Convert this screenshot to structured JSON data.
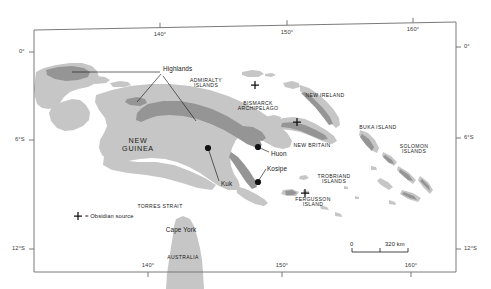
{
  "figure": {
    "type": "reference-map",
    "region": "New Guinea and Island Melanesia",
    "background_color": "#ffffff",
    "frame_color": "#6b6b6b",
    "land_lowland_color": "#c6c6c6",
    "land_highland_color": "#959595",
    "site_marker_color": "#111111",
    "text_color": "#1a1a1a"
  },
  "graticule": {
    "longitude_ticks": [
      {
        "label": "140°",
        "x": 160
      },
      {
        "label": "150°",
        "x": 287
      },
      {
        "label": "160°",
        "x": 413
      }
    ],
    "latitude_ticks": [
      {
        "label": "0°",
        "y": 52
      },
      {
        "label": "6°S",
        "y": 140
      },
      {
        "label": "12°S",
        "y": 249
      }
    ],
    "bottom_longitude_ticks": [
      {
        "label": "140°",
        "x": 148
      },
      {
        "label": "150°",
        "x": 282
      },
      {
        "label": "160°",
        "x": 411
      }
    ]
  },
  "labels": {
    "regions": [
      {
        "name": "new-guinea",
        "text": "NEW\nGUINEA",
        "x": 137,
        "y": 143,
        "style": "region"
      },
      {
        "name": "australia",
        "text": "AUSTRALIA",
        "x": 183,
        "y": 258,
        "style": "caps"
      },
      {
        "name": "cape-york",
        "text": "Cape York",
        "x": 181,
        "y": 231,
        "style": "site"
      },
      {
        "name": "torres-strait",
        "text": "TORRES STRAIT",
        "x": 160,
        "y": 207,
        "style": "caps"
      },
      {
        "name": "admiralty-islands",
        "text": "ADMIRALTY\nISLANDS",
        "x": 206,
        "y": 81,
        "style": "caps"
      },
      {
        "name": "bismarck-archipelago",
        "text": "BISMARCK\nARCHIPELAGO",
        "x": 258,
        "y": 104,
        "style": "caps"
      },
      {
        "name": "new-ireland",
        "text": "NEW IRELAND",
        "x": 325,
        "y": 96,
        "style": "caps"
      },
      {
        "name": "new-britain",
        "text": "NEW BRITAIN",
        "x": 312,
        "y": 146,
        "style": "caps"
      },
      {
        "name": "buka-island",
        "text": "BUKA ISLAND",
        "x": 378,
        "y": 128,
        "style": "caps"
      },
      {
        "name": "solomon-islands",
        "text": "SOLOMON\nISLANDS",
        "x": 414,
        "y": 147,
        "style": "caps"
      },
      {
        "name": "trobriand-islands",
        "text": "TROBRIAND\nISLANDS",
        "x": 334,
        "y": 177,
        "style": "caps"
      },
      {
        "name": "fergusson-island",
        "text": "FERGUSSON\nISLAND",
        "x": 312,
        "y": 200,
        "style": "caps"
      }
    ],
    "annotations": [
      {
        "name": "highlands",
        "text": "Highlands",
        "x": 163,
        "y": 69,
        "style": "site"
      }
    ],
    "sites": [
      {
        "name": "kuk",
        "text": "Kuk",
        "x": 221,
        "y": 184,
        "dot_x": 208,
        "dot_y": 148
      },
      {
        "name": "huon",
        "text": "Huon",
        "x": 271,
        "y": 155,
        "dot_x": 258,
        "dot_y": 147
      },
      {
        "name": "kosipe",
        "text": "Kosipe",
        "x": 267,
        "y": 170,
        "dot_x": 258,
        "dot_y": 182
      }
    ]
  },
  "legend": {
    "marker_glyph": "+",
    "text": "= Obsidian source",
    "x": 78,
    "y": 216
  },
  "scale_bar": {
    "start_label": "0",
    "end_label": "320 km",
    "x": 352,
    "y": 245,
    "width": 56,
    "segments": 2
  },
  "obsidian_sources": [
    {
      "name": "obsidian-admiralty",
      "x": 255,
      "y": 85
    },
    {
      "name": "obsidian-new-britain",
      "x": 297,
      "y": 122
    },
    {
      "name": "obsidian-fergusson",
      "x": 305,
      "y": 193
    }
  ]
}
